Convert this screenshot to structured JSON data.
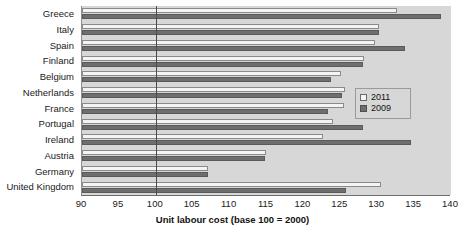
{
  "chart_data": {
    "type": "bar",
    "orientation": "horizontal",
    "title": "",
    "xlabel": "Unit labour cost (base 100 = 2000)",
    "ylabel": "",
    "xlim": [
      90,
      140
    ],
    "xticks": [
      90,
      95,
      100,
      105,
      110,
      115,
      120,
      125,
      130,
      135,
      140
    ],
    "grid": false,
    "reference_line": 100,
    "legend_position": "center-right",
    "categories": [
      "Greece",
      "Italy",
      "Spain",
      "Finland",
      "Belgium",
      "Netherlands",
      "France",
      "Portugal",
      "Ireland",
      "Austria",
      "Germany",
      "United Kingdom"
    ],
    "series": [
      {
        "name": "2011",
        "color": "#f4f4f4",
        "values": [
          132.7,
          130.2,
          129.7,
          128.2,
          125.1,
          125.6,
          125.5,
          124.0,
          122.6,
          114.9,
          107.1,
          130.5
        ]
      },
      {
        "name": "2009",
        "color": "#6e6e6e",
        "values": [
          138.6,
          130.2,
          133.8,
          128.1,
          123.7,
          125.2,
          123.3,
          128.1,
          134.6,
          114.8,
          107.1,
          125.8
        ]
      }
    ]
  },
  "legend": {
    "entries": [
      {
        "label": "2011"
      },
      {
        "label": "2009"
      }
    ]
  },
  "colors": {
    "plot_background": "#d7d7d7",
    "bar_2011": "#f4f4f4",
    "bar_2009": "#6e6e6e",
    "axis": "#6b6b6b",
    "reference_line": "#4a4a4a",
    "text": "#1a1a1a"
  }
}
